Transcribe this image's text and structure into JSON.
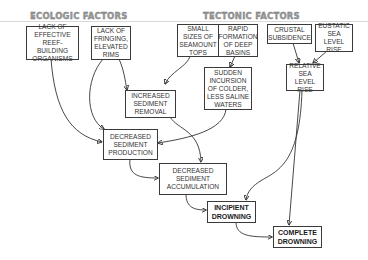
{
  "headers": {
    "ecologic": "ECOLOGIC FACTORS",
    "tectonic": "TECTONIC FACTORS"
  },
  "nodes": {
    "lack_reef_builders": "LACK OF\nEFFECTIVE\nREEF-BUILDING\nORGANISMS",
    "lack_fringing_rims": "LACK OF\nFRINGING,\nELEVATED\nRIMS",
    "small_seamount_tops": "SMALL\nSIZES OF\nSEAMOUNT\nTOPS",
    "rapid_deep_basins": "RAPID\nFORMATION\nOF DEEP\nBASINS",
    "crustal_subsidence": "CRUSTAL\nSUBSIDENCE",
    "eustatic_sea_level_rise": "EUSTATIC\nSEA LEVEL\nRISE",
    "sudden_incursion": "SUDDEN\nINCURSION\nOF COLDER,\nLESS SALINE\nWATERS",
    "relative_sea_level_rise": "RELATIVE\nSEA LEVEL\nRISE",
    "increased_sediment_removal": "INCREASED\nSEDIMENT\nREMOVAL",
    "decreased_sediment_production": "DECREASED\nSEDIMENT\nPRODUCTION",
    "decreased_sediment_accumulation": "DECREASED\nSEDIMENT\nACCUMULATION",
    "incipient_drowning": "INCIPIENT\nDROWNING",
    "complete_drowning": "COMPLETE\nDROWNING"
  },
  "edges": [
    {
      "from": "lack_reef_builders",
      "to": "decreased_sediment_production"
    },
    {
      "from": "lack_fringing_rims",
      "to": "increased_sediment_removal"
    },
    {
      "from": "lack_fringing_rims",
      "to": "decreased_sediment_production"
    },
    {
      "from": "small_seamount_tops",
      "to": "increased_sediment_removal"
    },
    {
      "from": "rapid_deep_basins",
      "to": "sudden_incursion"
    },
    {
      "from": "crustal_subsidence",
      "to": "relative_sea_level_rise"
    },
    {
      "from": "eustatic_sea_level_rise",
      "to": "relative_sea_level_rise"
    },
    {
      "from": "sudden_incursion",
      "to": "decreased_sediment_production"
    },
    {
      "from": "increased_sediment_removal",
      "to": "decreased_sediment_accumulation"
    },
    {
      "from": "decreased_sediment_production",
      "to": "decreased_sediment_accumulation"
    },
    {
      "from": "decreased_sediment_accumulation",
      "to": "incipient_drowning"
    },
    {
      "from": "relative_sea_level_rise",
      "to": "incipient_drowning"
    },
    {
      "from": "relative_sea_level_rise",
      "to": "complete_drowning"
    },
    {
      "from": "incipient_drowning",
      "to": "complete_drowning"
    }
  ]
}
